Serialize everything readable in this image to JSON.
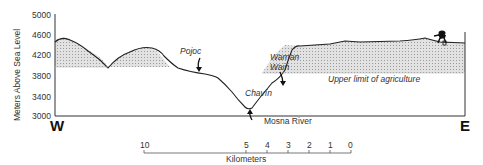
{
  "y_axis": {
    "label": "Meters Above Sea Level",
    "ticks": [
      "5000",
      "4600",
      "4200",
      "3800",
      "3400",
      "3000"
    ]
  },
  "directions": {
    "west": "W",
    "east": "E"
  },
  "places": {
    "pojoc": "Pojoc",
    "waman_wain_line1": "Waman",
    "waman_wain_line2": "Wain",
    "chavin": "Chavín",
    "mosna_river": "Mosna River",
    "agriculture_limit": "Upper limit of agriculture"
  },
  "scale_bar": {
    "label": "Kilometers",
    "ticks": [
      "10",
      "5",
      "4",
      "3",
      "2",
      "1",
      "0"
    ]
  },
  "colors": {
    "line": "#222222",
    "shade": "#cfcfcf"
  }
}
